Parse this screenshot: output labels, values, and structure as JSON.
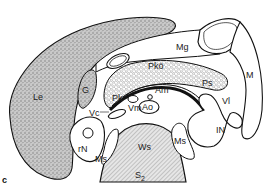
{
  "figure": {
    "panel_letter": "c",
    "type": "anatomical cross-section diagram",
    "labels": {
      "liver": "Le",
      "gallbladder": "G",
      "mesogastrium": "Mg",
      "stomach": "M",
      "pancreas_body": "Pkö",
      "pancreas": "Pk",
      "pancreas_tail": "Ps",
      "aorta_branch": "Am",
      "aorta": "Ao",
      "vena_mesenterica": "Vm",
      "vena_cava": "Vc",
      "vena_lienalis": "Vl",
      "intestine": "IN",
      "kidney_right": "rN",
      "muscle_left": "Ms",
      "muscle_right": "Ms",
      "vertebra": "Ws",
      "spine_level": "S",
      "spine_level_sub": "2"
    }
  },
  "colors": {
    "outline": "#111111",
    "stipple_fill": "#b8b8b8",
    "hatch": "#9a9a9a",
    "background": "#ffffff"
  }
}
